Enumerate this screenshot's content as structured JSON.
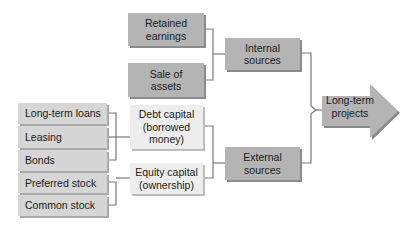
{
  "diagram": {
    "internal_inputs": [
      {
        "label": "Retained\nearnings"
      },
      {
        "label": "Sale of\nassets"
      }
    ],
    "internal": {
      "label": "Internal\nsources"
    },
    "debt_inputs": [
      {
        "label": "Long-term loans"
      },
      {
        "label": "Leasing"
      },
      {
        "label": "Bonds"
      }
    ],
    "equity_inputs": [
      {
        "label": "Preferred stock"
      },
      {
        "label": "Common stock"
      }
    ],
    "debt": {
      "label": "Debt capital\n(borrowed\nmoney)"
    },
    "equity": {
      "label": "Equity capital\n(ownership)"
    },
    "external": {
      "label": "External\nsources"
    },
    "target": {
      "label": "Long-term\nprojects"
    },
    "colors": {
      "dark_box": "#b4b4b4",
      "light_box": "#ededed",
      "stack_box": "#d6d6d6",
      "connector": "#7a7a7a"
    }
  }
}
